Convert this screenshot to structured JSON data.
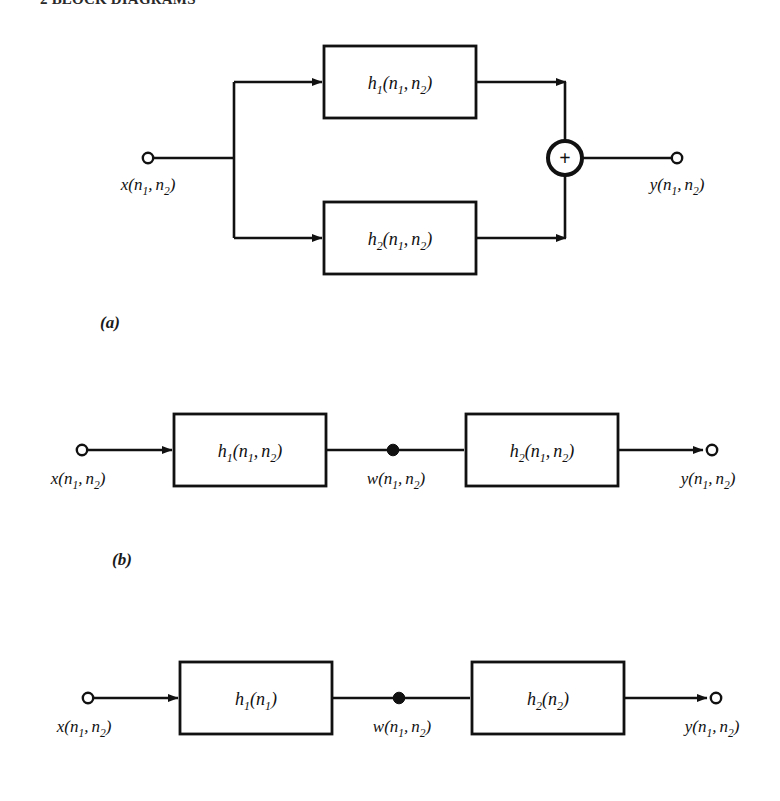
{
  "page": {
    "background_color": "#ffffff",
    "ink_color": "#111111",
    "width": 780,
    "height": 801
  },
  "heading": {
    "text": "2  BLOCK DIAGRAMS",
    "note": "clipped at top edge of screenshot"
  },
  "sub_labels": [
    {
      "id": "a",
      "text": "(a)",
      "x": 100,
      "y": 325
    },
    {
      "id": "b",
      "text": "(b)",
      "x": 112,
      "y": 562
    }
  ],
  "diagrams": [
    {
      "id": "diagram-a",
      "caption": "(a)",
      "kind": "parallel-connection",
      "input": {
        "label_main": "x",
        "label_args": "(n1, n2)",
        "terminal": "open-circle"
      },
      "output": {
        "label_main": "y",
        "label_args": "(n1, n2)",
        "terminal": "open-circle"
      },
      "adder": {
        "symbol": "+",
        "shape": "circle"
      },
      "blocks": [
        {
          "id": "h1-a",
          "main": "h",
          "sub": "1",
          "args": "(n1, n2)"
        },
        {
          "id": "h2-a",
          "main": "h",
          "sub": "2",
          "args": "(n1, n2)"
        }
      ]
    },
    {
      "id": "diagram-b",
      "caption": "(b)",
      "kind": "cascade-connection",
      "input": {
        "label_main": "x",
        "label_args": "(n1, n2)",
        "terminal": "open-circle"
      },
      "output": {
        "label_main": "y",
        "label_args": "(n1, n2)",
        "terminal": "open-circle"
      },
      "intermediate": {
        "label_main": "w",
        "label_args": "(n1, n2)",
        "terminal": "filled-dot"
      },
      "blocks": [
        {
          "id": "h1-b",
          "main": "h",
          "sub": "1",
          "args": "(n1, n2)"
        },
        {
          "id": "h2-b",
          "main": "h",
          "sub": "2",
          "args": "(n1, n2)"
        }
      ]
    },
    {
      "id": "diagram-c",
      "caption": "",
      "kind": "separable-cascade-connection",
      "input": {
        "label_main": "x",
        "label_args": "(n1, n2)",
        "terminal": "open-circle"
      },
      "output": {
        "label_main": "y",
        "label_args": "(n1, n2)",
        "terminal": "open-circle"
      },
      "intermediate": {
        "label_main": "w",
        "label_args": "(n1, n2)",
        "terminal": "filled-dot"
      },
      "blocks": [
        {
          "id": "h1-c",
          "main": "h",
          "sub": "1",
          "args": "(n1)"
        },
        {
          "id": "h2-c",
          "main": "h",
          "sub": "2",
          "args": "(n2)"
        }
      ]
    }
  ],
  "symbols": {
    "x_main": "x",
    "y_main": "y",
    "w_main": "w",
    "h_main": "h",
    "n_main": "n",
    "sub_1": "1",
    "sub_2": "2",
    "paren_open": "(",
    "paren_close": ")",
    "comma": ",",
    "plus": "+"
  }
}
